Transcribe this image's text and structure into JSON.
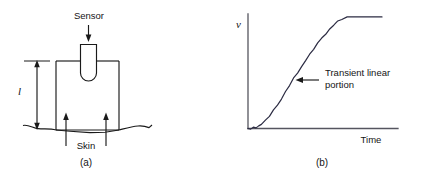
{
  "figure": {
    "background_color": "#ffffff",
    "ink_color": "#1a1a1a"
  },
  "panel_a": {
    "caption": "(a)",
    "sensor_label": "Sensor",
    "skin_label": "Skin",
    "length_label": "l",
    "description": "Sensor probe inserted into a rectangular block resting on skin; l marks block height"
  },
  "panel_b": {
    "caption": "(b)",
    "annotation_line_1": "Transient linear",
    "annotation_line_2": "portion"
  },
  "chart_data": {
    "type": "line",
    "title": "",
    "xlabel": "Time",
    "ylabel": "v",
    "grid": false,
    "legend": null,
    "axis_origin": [
      248,
      128
    ],
    "xlim": [
      0,
      1
    ],
    "ylim": [
      0,
      1
    ],
    "annotations": [
      {
        "text": "Transient linear portion",
        "arrow_from": [
          318,
          80
        ],
        "arrow_to": [
          296,
          80
        ]
      }
    ],
    "x": [
      0.0,
      0.02,
      0.04,
      0.06,
      0.08,
      0.1,
      0.13,
      0.16,
      0.19,
      0.22,
      0.25,
      0.28,
      0.31,
      0.34,
      0.37,
      0.4,
      0.43,
      0.46,
      0.49,
      0.52,
      0.55,
      0.58,
      0.61,
      0.64,
      0.67,
      0.7,
      0.74,
      0.78,
      0.82,
      0.86,
      0.9,
      0.94,
      1.0
    ],
    "y": [
      0.0,
      0.0,
      0.01,
      0.01,
      0.02,
      0.04,
      0.07,
      0.11,
      0.16,
      0.21,
      0.27,
      0.33,
      0.39,
      0.45,
      0.5,
      0.55,
      0.61,
      0.66,
      0.71,
      0.76,
      0.81,
      0.85,
      0.89,
      0.93,
      0.96,
      0.98,
      1.0,
      1.0,
      1.0,
      1.0,
      1.0,
      1.0,
      1.0
    ]
  }
}
